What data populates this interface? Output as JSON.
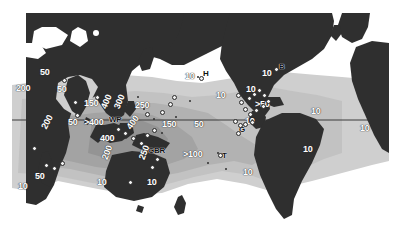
{
  "figure": {
    "type": "map",
    "projection": "cylindrical-equirectangular",
    "width": 399,
    "height": 236,
    "map_rect": {
      "x": 12,
      "y": 13,
      "width": 377,
      "height": 213
    },
    "colors": {
      "land": "#2f2f2f",
      "ocean_outer": "#ffffff",
      "ocean_mid": "#cfcfcf",
      "ocean_inner": "#b0b0b0",
      "ocean_core": "#9a9a9a",
      "label_light": "#ffffff",
      "label_dark": "#111111",
      "equator_line": "#3a3a3a",
      "site_marker_fill": "#f2f2f2",
      "site_marker_stroke": "#2a2a2a",
      "background": "#ffffff"
    },
    "equator": {
      "label": "equator",
      "y_px": 120,
      "visible": true
    }
  },
  "legend": {
    "contour_units": "number of coral species",
    "contour_levels": [
      10,
      50,
      100,
      150,
      200,
      250,
      300,
      350,
      400
    ],
    "locality_codes": [
      {
        "code": "WP",
        "name": "West Pacific / Coral Triangle"
      },
      {
        "code": "GBR",
        "name": "Great Barrier Reef"
      },
      {
        "code": "H",
        "name": "Hawaii"
      },
      {
        "code": "T",
        "name": "Tahiti"
      },
      {
        "code": "B",
        "name": "Bermuda"
      },
      {
        "code": "G",
        "name": "Galapagos"
      }
    ]
  },
  "contour_labels": [
    {
      "id": "l01",
      "text": "50",
      "x": 40,
      "y": 68,
      "rot": 0,
      "tone": "light"
    },
    {
      "id": "l02",
      "text": "200",
      "x": 16,
      "y": 84,
      "rot": 0,
      "tone": "light"
    },
    {
      "id": "l03",
      "text": "50",
      "x": 57,
      "y": 85,
      "rot": 0,
      "tone": "light"
    },
    {
      "id": "l04",
      "text": "50",
      "x": 68,
      "y": 118,
      "rot": 0,
      "tone": "light"
    },
    {
      "id": "l05",
      "text": "200",
      "x": 44,
      "y": 124,
      "rot": -62,
      "tone": "light"
    },
    {
      "id": "l06",
      "text": "150",
      "x": 84,
      "y": 99,
      "rot": 0,
      "tone": "light"
    },
    {
      "id": "l07",
      "text": ">400",
      "x": 84,
      "y": 118,
      "rot": 0,
      "tone": "light"
    },
    {
      "id": "l08",
      "text": "400",
      "x": 104,
      "y": 104,
      "rot": -68,
      "tone": "light"
    },
    {
      "id": "l09",
      "text": "300",
      "x": 117,
      "y": 104,
      "rot": -68,
      "tone": "light"
    },
    {
      "id": "l10",
      "text": "250",
      "x": 135,
      "y": 101,
      "rot": 0,
      "tone": "light"
    },
    {
      "id": "l11",
      "text": "400",
      "x": 100,
      "y": 134,
      "rot": 0,
      "tone": "light"
    },
    {
      "id": "l12",
      "text": "400",
      "x": 129,
      "y": 124,
      "rot": -55,
      "tone": "light"
    },
    {
      "id": "l13",
      "text": "150",
      "x": 162,
      "y": 120,
      "rot": 0,
      "tone": "light"
    },
    {
      "id": "l14",
      "text": "50",
      "x": 194,
      "y": 120,
      "rot": 0,
      "tone": "light"
    },
    {
      "id": "l15",
      "text": "200",
      "x": 105,
      "y": 155,
      "rot": -70,
      "tone": "light"
    },
    {
      "id": "l16",
      "text": "250",
      "x": 142,
      "y": 155,
      "rot": -70,
      "tone": "light"
    },
    {
      "id": "l17",
      "text": ">100",
      "x": 183,
      "y": 150,
      "rot": 0,
      "tone": "light"
    },
    {
      "id": "l18",
      "text": "10",
      "x": 97,
      "y": 178,
      "rot": 0,
      "tone": "light"
    },
    {
      "id": "l19",
      "text": "10",
      "x": 147,
      "y": 178,
      "rot": 0,
      "tone": "light"
    },
    {
      "id": "l20",
      "text": "50",
      "x": 35,
      "y": 172,
      "rot": 0,
      "tone": "light"
    },
    {
      "id": "l21",
      "text": "10",
      "x": 18,
      "y": 182,
      "rot": 0,
      "tone": "light"
    },
    {
      "id": "l22",
      "text": "10",
      "x": 185,
      "y": 72,
      "rot": 0,
      "tone": "light"
    },
    {
      "id": "l23",
      "text": "10",
      "x": 262,
      "y": 69,
      "rot": 0,
      "tone": "light"
    },
    {
      "id": "l24",
      "text": "10",
      "x": 246,
      "y": 85,
      "rot": 0,
      "tone": "light"
    },
    {
      "id": "l25",
      "text": "10",
      "x": 216,
      "y": 91,
      "rot": 0,
      "tone": "light"
    },
    {
      "id": "l26",
      "text": ">50",
      "x": 255,
      "y": 100,
      "rot": 0,
      "tone": "light"
    },
    {
      "id": "l27",
      "text": "10",
      "x": 245,
      "y": 117,
      "rot": 0,
      "tone": "light"
    },
    {
      "id": "l28",
      "text": "10",
      "x": 311,
      "y": 107,
      "rot": 0,
      "tone": "light"
    },
    {
      "id": "l29",
      "text": "10",
      "x": 360,
      "y": 124,
      "rot": 0,
      "tone": "light"
    },
    {
      "id": "l30",
      "text": "10",
      "x": 303,
      "y": 145,
      "rot": 0,
      "tone": "light"
    },
    {
      "id": "l31",
      "text": "10",
      "x": 243,
      "y": 168,
      "rot": 0,
      "tone": "light"
    }
  ],
  "site_labels": [
    {
      "id": "s1",
      "text": "WP",
      "x": 109,
      "y": 116,
      "tone": "dark"
    },
    {
      "id": "s2",
      "text": "GBR",
      "x": 148,
      "y": 147,
      "tone": "dark"
    },
    {
      "id": "s3",
      "text": "H",
      "x": 203,
      "y": 70,
      "tone": "dark"
    },
    {
      "id": "s4",
      "text": "T",
      "x": 222,
      "y": 152,
      "tone": "dark"
    },
    {
      "id": "s5",
      "text": "B",
      "x": 279,
      "y": 63,
      "tone": "dark"
    },
    {
      "id": "s6",
      "text": "G",
      "x": 239,
      "y": 126,
      "tone": "dark"
    }
  ],
  "site_markers": [
    {
      "id": "m01",
      "x": 199,
      "y": 76
    },
    {
      "id": "m02",
      "x": 274,
      "y": 67
    },
    {
      "id": "m03",
      "x": 218,
      "y": 153
    },
    {
      "id": "m04",
      "x": 236,
      "y": 131
    },
    {
      "id": "m05",
      "x": 233,
      "y": 119
    },
    {
      "id": "m06",
      "x": 238,
      "y": 123
    },
    {
      "id": "m07",
      "x": 247,
      "y": 96
    },
    {
      "id": "m08",
      "x": 252,
      "y": 92
    },
    {
      "id": "m09",
      "x": 257,
      "y": 88
    },
    {
      "id": "m10",
      "x": 262,
      "y": 93
    },
    {
      "id": "m11",
      "x": 266,
      "y": 99
    },
    {
      "id": "m12",
      "x": 261,
      "y": 104
    },
    {
      "id": "m13",
      "x": 254,
      "y": 108
    },
    {
      "id": "m14",
      "x": 248,
      "y": 112
    },
    {
      "id": "m15",
      "x": 243,
      "y": 107
    },
    {
      "id": "m16",
      "x": 239,
      "y": 100
    },
    {
      "id": "m17",
      "x": 236,
      "y": 93
    },
    {
      "id": "m18",
      "x": 243,
      "y": 122
    },
    {
      "id": "m19",
      "x": 250,
      "y": 120
    },
    {
      "id": "m20",
      "x": 62,
      "y": 78
    },
    {
      "id": "m21",
      "x": 73,
      "y": 100
    },
    {
      "id": "m22",
      "x": 75,
      "y": 113
    },
    {
      "id": "m23",
      "x": 32,
      "y": 146
    },
    {
      "id": "m24",
      "x": 44,
      "y": 163
    },
    {
      "id": "m25",
      "x": 52,
      "y": 166
    },
    {
      "id": "m26",
      "x": 60,
      "y": 161
    },
    {
      "id": "m27",
      "x": 116,
      "y": 127
    },
    {
      "id": "m28",
      "x": 123,
      "y": 131
    },
    {
      "id": "m29",
      "x": 131,
      "y": 136
    },
    {
      "id": "m30",
      "x": 139,
      "y": 141
    },
    {
      "id": "m31",
      "x": 145,
      "y": 133
    },
    {
      "id": "m32",
      "x": 152,
      "y": 128
    },
    {
      "id": "m33",
      "x": 155,
      "y": 157
    },
    {
      "id": "m34",
      "x": 150,
      "y": 165
    },
    {
      "id": "m35",
      "x": 145,
      "y": 112
    },
    {
      "id": "m36",
      "x": 160,
      "y": 110
    },
    {
      "id": "m37",
      "x": 172,
      "y": 95
    },
    {
      "id": "m38",
      "x": 168,
      "y": 102
    },
    {
      "id": "m39",
      "x": 128,
      "y": 180
    },
    {
      "id": "m40",
      "x": 95,
      "y": 95
    }
  ]
}
